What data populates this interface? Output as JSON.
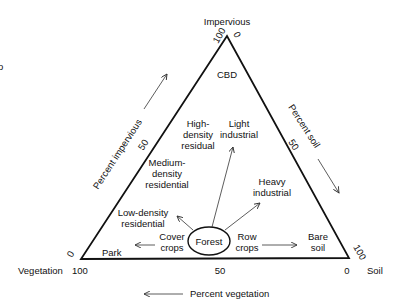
{
  "diagram": {
    "vertices": {
      "top": {
        "label": "Impervious",
        "tick_left": "100",
        "tick_right": "0"
      },
      "left": {
        "label": "Vegetation",
        "tick_bottom": "100",
        "tick_side": "0"
      },
      "right": {
        "label": "Soil",
        "tick_bottom": "0",
        "tick_side": "100"
      }
    },
    "axes": {
      "left": {
        "label": "Percent impervious",
        "mid_tick": "50"
      },
      "right": {
        "label": "Percent soil",
        "mid_tick": "50"
      },
      "bottom": {
        "label": "Percent vegetation",
        "mid_tick": "50"
      }
    },
    "classes": {
      "cbd": "CBD",
      "high_density": [
        "High-",
        "density",
        "residual"
      ],
      "light_industrial": [
        "Light",
        "industrial"
      ],
      "medium_density": [
        "Medium-",
        "density",
        "residential"
      ],
      "heavy_industrial": [
        "Heavy",
        "industrial"
      ],
      "low_density": [
        "Low-density",
        "residential"
      ],
      "cover_crops": [
        "Cover",
        "crops"
      ],
      "forest": "Forest",
      "row_crops": [
        "Row",
        "crops"
      ],
      "bare_soil": [
        "Bare",
        "soil"
      ],
      "park": "Park"
    },
    "stray_mark": "o"
  }
}
